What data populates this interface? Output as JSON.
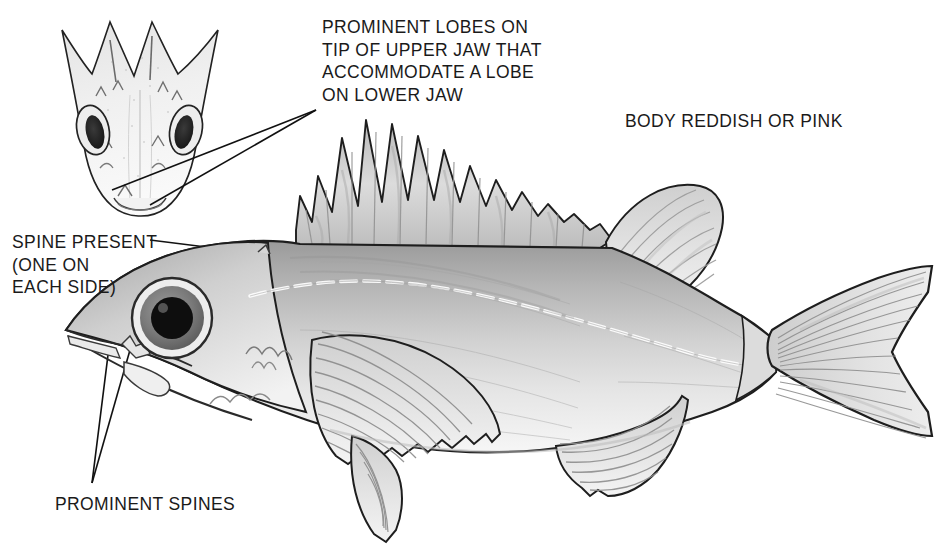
{
  "figure": {
    "background_color": "#ffffff",
    "ink_color": "#1a1a1a",
    "medium": "graphite-pencil-drawing"
  },
  "annotations": {
    "upper_jaw_lobes": {
      "text": "PROMINENT LOBES ON\nTIP OF UPPER JAW THAT\nACCOMMODATE A LOBE\nON LOWER JAW",
      "lines": [
        "PROMINENT LOBES ON",
        "TIP OF UPPER JAW THAT",
        "ACCOMMODATE A LOBE",
        "ON LOWER JAW"
      ],
      "leader_count": 2,
      "points_to": "head-inset-jaw"
    },
    "head_spine": {
      "text": "SPINE PRESENT\n(ONE ON\nEACH SIDE)",
      "lines": [
        "SPINE PRESENT",
        "(ONE ON",
        "EACH SIDE)"
      ],
      "leader_count": 1,
      "points_to": "nuchal-spine"
    },
    "opercular_spines": {
      "text": "PROMINENT SPINES",
      "lines": [
        "PROMINENT SPINES"
      ],
      "leader_count": 2,
      "points_to": "opercle-spines"
    },
    "body_color": {
      "text": "BODY REDDISH OR PINK",
      "lines": [
        "BODY REDDISH OR PINK"
      ],
      "leader_count": 0,
      "points_to": "body"
    }
  },
  "fish_parts": {
    "head_inset": "dorsal-view-of-head-with-two-eyes",
    "eye": "large-round-eye-with-dark-pupil",
    "spiny_dorsal_fin": "thirteen-triangular-spines-decreasing-in-height",
    "soft_dorsal_fin": "rounded-rayed-fin",
    "pectoral_fin": "large-fan-shaped-rayed-fin",
    "pelvic_fin": "pointed-rayed-fin",
    "anal_fin": "triangular-rayed-fin",
    "caudal_fin": "slightly-forked-tail-with-radiating-rays",
    "lateral_line": "pale-curved-line-along-flank",
    "caudal_peduncle": "narrow"
  }
}
